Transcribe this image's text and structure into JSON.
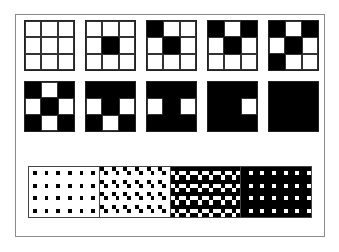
{
  "figure": {
    "colors": {
      "on": "#000000",
      "off": "#ffffff",
      "frame": "#8a8a8a"
    },
    "dither_order": [
      [
        1,
        1
      ],
      [
        0,
        0
      ],
      [
        0,
        2
      ],
      [
        2,
        0
      ],
      [
        2,
        2
      ],
      [
        0,
        1
      ],
      [
        2,
        1
      ],
      [
        1,
        0
      ],
      [
        1,
        2
      ]
    ],
    "grids": [
      {
        "level": 0,
        "row": 0,
        "col": 0
      },
      {
        "level": 1,
        "row": 0,
        "col": 1
      },
      {
        "level": 2,
        "row": 0,
        "col": 2
      },
      {
        "level": 3,
        "row": 0,
        "col": 3
      },
      {
        "level": 4,
        "row": 0,
        "col": 4
      },
      {
        "level": 5,
        "row": 1,
        "col": 0
      },
      {
        "level": 6,
        "row": 1,
        "col": 1
      },
      {
        "level": 7,
        "row": 1,
        "col": 2
      },
      {
        "level": 8,
        "row": 1,
        "col": 3
      },
      {
        "level": 9,
        "row": 1,
        "col": 4
      }
    ],
    "strip": {
      "sections": [
        {
          "level": 1
        },
        {
          "level": 2
        },
        {
          "level": 6
        },
        {
          "level": 8
        }
      ],
      "tiles_x": 6,
      "tiles_y": 4
    }
  }
}
